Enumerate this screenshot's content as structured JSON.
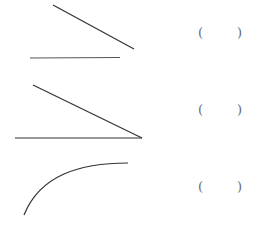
{
  "figures": [
    {
      "id": 1,
      "type": "two-separate-segments",
      "answer_blank": {
        "open": "(",
        "close": ")"
      }
    },
    {
      "id": 2,
      "type": "angle",
      "answer_blank": {
        "open": "(",
        "close": ")"
      }
    },
    {
      "id": 3,
      "type": "curve",
      "answer_blank": {
        "open": "(",
        "close": ")"
      }
    }
  ],
  "colors": {
    "stroke": "#333333",
    "paren": "#666666"
  }
}
